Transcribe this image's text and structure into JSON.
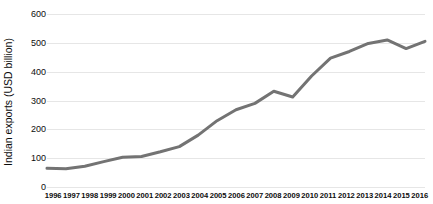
{
  "chart_data": {
    "type": "line",
    "title": "",
    "xlabel": "",
    "ylabel": "Indian exports (USD billion)",
    "categories": [
      "1996",
      "1997",
      "1998",
      "1999",
      "2000",
      "2001",
      "2002",
      "2003",
      "2004",
      "2005",
      "2006",
      "2007",
      "2008",
      "2009",
      "2010",
      "2011",
      "2012",
      "2013",
      "2014",
      "2015",
      "2016"
    ],
    "values": [
      65,
      63,
      72,
      88,
      103,
      106,
      122,
      140,
      180,
      230,
      268,
      290,
      332,
      312,
      385,
      447,
      470,
      498,
      510,
      480,
      505
    ],
    "series": [
      {
        "name": "Indian exports",
        "values": [
          65,
          63,
          72,
          88,
          103,
          106,
          122,
          140,
          180,
          230,
          268,
          290,
          332,
          312,
          385,
          447,
          470,
          498,
          510,
          480,
          505
        ]
      }
    ],
    "ylim": [
      0,
      600
    ],
    "yticks": [
      0,
      100,
      200,
      300,
      400,
      500,
      600
    ],
    "ytick_labels": [
      "0",
      "100",
      "200",
      "300",
      "400",
      "500",
      "600"
    ],
    "grid": "horizontal-only",
    "legend": "none",
    "line_color": "#737373",
    "line_width": 3,
    "grid_color": "#e6e6e6",
    "background_color": "#ffffff",
    "text_color": "#0d0d0d"
  }
}
